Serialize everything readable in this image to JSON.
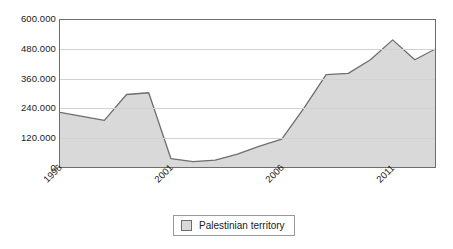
{
  "chart_data": {
    "type": "area",
    "title": "",
    "subtitle": "",
    "xlabel": "",
    "ylabel": "",
    "grid": true,
    "legend_position": "bottom-center",
    "xlim": [
      1996,
      2013
    ],
    "ylim": [
      0,
      600000
    ],
    "y_ticks": [
      0,
      120000,
      240000,
      360000,
      480000,
      600000
    ],
    "y_tick_labels": [
      "0",
      "120.000",
      "240.000",
      "360.000",
      "480.000",
      "600.000"
    ],
    "x_ticks": [
      1996,
      2001,
      2006,
      2011
    ],
    "x_tick_labels": [
      "1996",
      "2001",
      "2006",
      "2011"
    ],
    "x": [
      1996,
      1997,
      1998,
      1999,
      2000,
      2001,
      2002,
      2003,
      2004,
      2005,
      2006,
      2007,
      2008,
      2009,
      2010,
      2011,
      2012,
      2013
    ],
    "categories": [
      "1996",
      "1997",
      "1998",
      "1999",
      "2000",
      "2001",
      "2002",
      "2003",
      "2004",
      "2005",
      "2006",
      "2007",
      "2008",
      "2009",
      "2010",
      "2011",
      "2012",
      "2013"
    ],
    "series": [
      {
        "name": "Palestinian territory",
        "color": "#d9d9d9",
        "line_color": "#6e6e6e",
        "values": [
          228000,
          212000,
          196000,
          300000,
          307000,
          42000,
          30000,
          36000,
          60000,
          92000,
          120000,
          245000,
          380000,
          385000,
          440000,
          520000,
          440000,
          487000
        ]
      }
    ]
  },
  "legend": {
    "items": [
      {
        "label": "Palestinian territory",
        "swatch_color": "#d9d9d9"
      }
    ]
  },
  "axes": {
    "y": {
      "labels": [
        "600.000",
        "480.000",
        "360.000",
        "240.000",
        "120.000",
        "0"
      ]
    },
    "x": {
      "labels": [
        "1996",
        "2001",
        "2006",
        "2011"
      ]
    }
  },
  "colors": {
    "area_fill": "#d9d9d9",
    "line": "#6e6e6e",
    "frame": "#6e6e6e",
    "gridline": "#d2d2d2",
    "background": "#ffffff",
    "text": "#1a1a1a"
  }
}
